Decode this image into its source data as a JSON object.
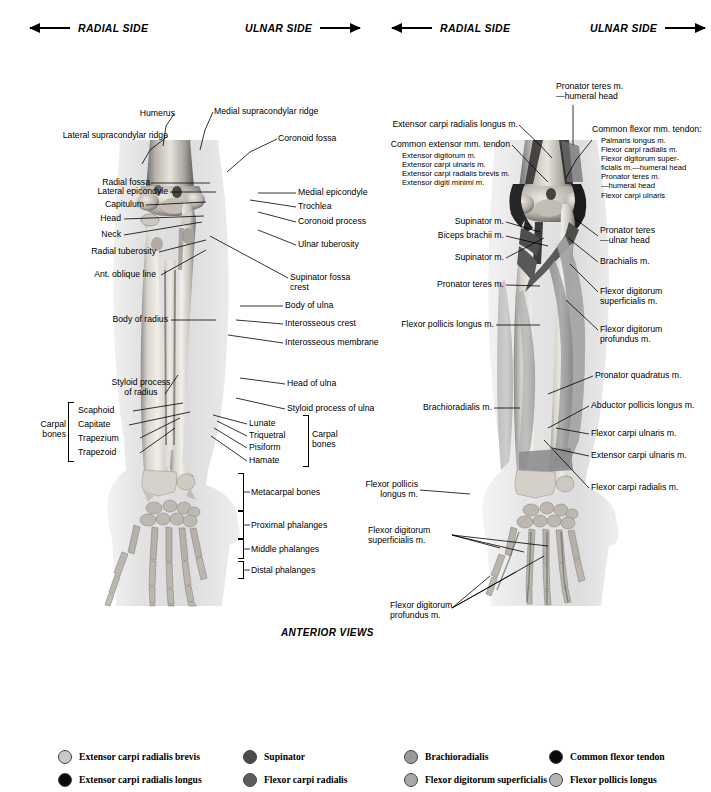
{
  "header": {
    "left_figure": {
      "radial": "RADIAL\nSIDE",
      "ulnar": "ULNAR\nSIDE"
    },
    "right_figure": {
      "radial": "RADIAL\nSIDE",
      "ulnar": "ULNAR\nSIDE"
    }
  },
  "caption": "ANTERIOR VIEWS",
  "left_figure": {
    "labels": [
      {
        "id": "humerus",
        "text": "Humerus"
      },
      {
        "id": "medial-supracondylar-ridge",
        "text": "Medial supracondylar ridge"
      },
      {
        "id": "lateral-supracondylar-ridge",
        "text": "Lateral supracondylar ridge"
      },
      {
        "id": "coronoid-fossa",
        "text": "Coronoid fossa"
      },
      {
        "id": "radial-fossa",
        "text": "Radial fossa"
      },
      {
        "id": "lateral-epicondyle",
        "text": "Lateral epicondyle"
      },
      {
        "id": "medial-epicondyle",
        "text": "Medial epicondyle"
      },
      {
        "id": "capitulum",
        "text": "Capitulum"
      },
      {
        "id": "trochlea",
        "text": "Trochlea"
      },
      {
        "id": "head",
        "text": "Head"
      },
      {
        "id": "coronoid-process",
        "text": "Coronoid process"
      },
      {
        "id": "neck",
        "text": "Neck"
      },
      {
        "id": "radial-tuberosity",
        "text": "Radial tuberosity"
      },
      {
        "id": "ulnar-tuberosity",
        "text": "Ulnar tuberosity"
      },
      {
        "id": "ant-oblique-line",
        "text": "Ant. oblique line"
      },
      {
        "id": "supinator-fossa-crest",
        "text": "Supinator fossa\ncrest"
      },
      {
        "id": "body-of-radius",
        "text": "Body of radius"
      },
      {
        "id": "body-of-ulna",
        "text": "Body of ulna"
      },
      {
        "id": "interosseous-crest",
        "text": "Interosseous crest"
      },
      {
        "id": "interosseous-membrane",
        "text": "Interosseous membrane"
      },
      {
        "id": "styloid-process-of-radius",
        "text": "Styloid process\nof radius"
      },
      {
        "id": "head-of-ulna",
        "text": "Head of ulna"
      },
      {
        "id": "styloid-process-of-ulna",
        "text": "Styloid process of ulna"
      },
      {
        "id": "scaphoid",
        "text": "Scaphoid"
      },
      {
        "id": "capitate",
        "text": "Capitate"
      },
      {
        "id": "trapezium",
        "text": "Trapezium"
      },
      {
        "id": "trapezoid",
        "text": "Trapezoid"
      },
      {
        "id": "lunate",
        "text": "Lunate"
      },
      {
        "id": "triquetral",
        "text": "Triquetral"
      },
      {
        "id": "pisiform",
        "text": "Pisiform"
      },
      {
        "id": "hamate",
        "text": "Hamate"
      },
      {
        "id": "carpal-bones-left",
        "text": "Carpal\nbones"
      },
      {
        "id": "carpal-bones-right",
        "text": "Carpal\nbones"
      },
      {
        "id": "metacarpal-bones",
        "text": "Metacarpal bones"
      },
      {
        "id": "proximal-phalanges",
        "text": "Proximal phalanges"
      },
      {
        "id": "middle-phalanges",
        "text": "Middle phalanges"
      },
      {
        "id": "distal-phalanges",
        "text": "Distal phalanges"
      }
    ]
  },
  "right_figure": {
    "labels": [
      {
        "id": "pronator-teres-humeral-head",
        "text": "Pronator teres m.\n—humeral head"
      },
      {
        "id": "extensor-carpi-radialis-longus",
        "text": "Extensor carpi radialis longus m."
      },
      {
        "id": "common-extensor-tendon",
        "text": "Common extensor mm. tendon"
      },
      {
        "id": "common-extensor-sublist",
        "text": "Extensor digitorum m.\nExtensor carpi ulnaris m.\nExtensor carpi radialis brevis m.\nExtensor digiti minimi m."
      },
      {
        "id": "common-flexor-tendon",
        "text": "Common flexor mm. tendon:"
      },
      {
        "id": "common-flexor-sublist",
        "text": "Palmaris longus m.\nFlexor carpi radialis m.\nFlexor digitorum super-\nficialis m.—humeral head\nPronator teres m.\n—humeral head\nFlexor carpi ulnaris"
      },
      {
        "id": "supinator-upper",
        "text": "Supinator m."
      },
      {
        "id": "biceps-brachii",
        "text": "Biceps brachii m."
      },
      {
        "id": "supinator-lower",
        "text": "Supinator m."
      },
      {
        "id": "pronator-teres",
        "text": "Pronator teres m."
      },
      {
        "id": "pronator-teres-ulnar-head",
        "text": "Pronator teres\n—ulnar head"
      },
      {
        "id": "brachialis",
        "text": "Brachialis m."
      },
      {
        "id": "flexor-digitorum-superficialis-upper",
        "text": "Flexor digitorum\nsuperficialis m."
      },
      {
        "id": "flexor-pollicis-longus-upper",
        "text": "Flexor pollicis longus m."
      },
      {
        "id": "flexor-digitorum-profundus-upper",
        "text": "Flexor digitorum\nprofundus m."
      },
      {
        "id": "pronator-quadratus",
        "text": "Pronator quadratus m."
      },
      {
        "id": "brachioradialis",
        "text": "Brachioradialis m."
      },
      {
        "id": "abductor-pollicis-longus",
        "text": "Abductor pollicis longus m."
      },
      {
        "id": "flexor-carpi-ulnaris",
        "text": "Flexor carpi ulnaris m."
      },
      {
        "id": "extensor-carpi-ulnaris",
        "text": "Extensor carpi ulnaris m."
      },
      {
        "id": "flexor-carpi-radialis",
        "text": "Flexor carpi radialis m."
      },
      {
        "id": "flexor-pollicis-longus-lower",
        "text": "Flexor pollicis\nlongus m."
      },
      {
        "id": "flexor-digitorum-superficialis-lower",
        "text": "Flexor digitorum\nsuperficialis m."
      },
      {
        "id": "flexor-digitorum-profundus-lower",
        "text": "Flexor digitorum\nprofundus m."
      }
    ]
  },
  "legend": {
    "columns": [
      {
        "items": [
          {
            "label": "Extensor carpi radialis brevis",
            "color": "#c9c9c9"
          },
          {
            "label": "Extensor carpi radialis longus",
            "color": "#0a0a0a"
          }
        ]
      },
      {
        "items": [
          {
            "label": "Supinator",
            "color": "#4a4a4a"
          },
          {
            "label": "Flexor carpi radialis",
            "color": "#5c5c5c"
          }
        ]
      },
      {
        "items": [
          {
            "label": "Brachioradialis",
            "color": "#9a9a9a"
          },
          {
            "label": "Flexor digitorum superficialis",
            "color": "#a8a8a8"
          }
        ]
      },
      {
        "items": [
          {
            "label": "Common flexor tendon",
            "color": "#0a0a0a"
          },
          {
            "label": "Flexor pollicis longus",
            "color": "#b4b4b4"
          }
        ]
      }
    ]
  }
}
